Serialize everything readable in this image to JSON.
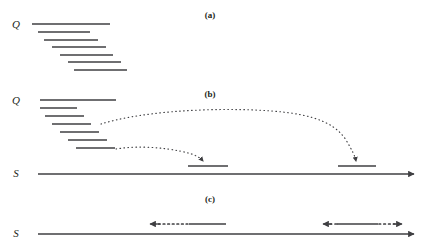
{
  "figure": {
    "width": 426,
    "height": 249,
    "background": "#ffffff",
    "ink_color": "#3f3f42",
    "text_color": "#231f20"
  },
  "panels": [
    {
      "id": "a",
      "label": "(a)",
      "label_x": 190,
      "label_y": 10,
      "axis_labels": [
        {
          "name": "query-label-a",
          "text": "Q",
          "x": 14,
          "y": 18
        }
      ],
      "segments": [
        {
          "x1": 32,
          "x2": 110,
          "y": 24
        },
        {
          "x1": 38,
          "x2": 90,
          "y": 32
        },
        {
          "x1": 44,
          "x2": 98,
          "y": 40
        },
        {
          "x1": 52,
          "x2": 106,
          "y": 47
        },
        {
          "x1": 60,
          "x2": 113,
          "y": 55
        },
        {
          "x1": 68,
          "x2": 121,
          "y": 62
        },
        {
          "x1": 74,
          "x2": 127,
          "y": 70
        }
      ]
    },
    {
      "id": "b",
      "label": "(b)",
      "label_x": 190,
      "label_y": 89,
      "axis_labels": [
        {
          "name": "query-label-b",
          "text": "Q",
          "x": 14,
          "y": 94
        },
        {
          "name": "subject-label-b",
          "text": "S",
          "x": 14,
          "y": 168
        }
      ],
      "segments": [
        {
          "x1": 40,
          "x2": 116,
          "y": 100
        },
        {
          "x1": 40,
          "x2": 77,
          "y": 108
        },
        {
          "x1": 45,
          "x2": 84,
          "y": 116
        },
        {
          "x1": 52,
          "x2": 91,
          "y": 124
        },
        {
          "x1": 60,
          "x2": 99,
          "y": 132
        },
        {
          "x1": 68,
          "x2": 107,
          "y": 140
        },
        {
          "x1": 76,
          "x2": 115,
          "y": 148
        }
      ],
      "subject_axis": {
        "x1": 38,
        "x2": 416,
        "y": 174,
        "arrow": "right"
      },
      "subject_hits": [
        {
          "name": "subject-hit-left",
          "x1": 188,
          "x2": 228,
          "y": 166
        },
        {
          "name": "subject-hit-right",
          "x1": 338,
          "x2": 376,
          "y": 166
        }
      ],
      "mapping_arrows": [
        {
          "name": "mapping-arrow-upper",
          "from_segment": 4,
          "to_hit": "subject-hit-right",
          "style": "dotted",
          "arrowhead": "down",
          "path": "M 101 124 C 140 112, 200 108, 255 110 C 300 112, 330 118, 345 138 C 352 148, 355 155, 356 162"
        },
        {
          "name": "mapping-arrow-lower",
          "from_segment": 7,
          "to_hit": "subject-hit-left",
          "style": "dotted",
          "arrowhead": "down",
          "path": "M 116 149 C 134 146, 150 147, 166 149 C 184 151, 196 153, 203 160"
        }
      ]
    },
    {
      "id": "c",
      "label": "(c)",
      "label_x": 190,
      "label_y": 194,
      "axis_labels": [
        {
          "name": "subject-label-c",
          "text": "S",
          "x": 14,
          "y": 228
        }
      ],
      "subject_axis": {
        "x1": 38,
        "x2": 416,
        "y": 234,
        "arrow": "right"
      },
      "intervals": [
        {
          "name": "interval-left",
          "left_arrow": true,
          "right_arrow": false,
          "x1": 148,
          "x2": 226,
          "dotted_from": 152,
          "dotted_to": 189,
          "solid_from": 189,
          "solid_to": 226,
          "y": 224
        },
        {
          "name": "interval-right",
          "left_arrow": true,
          "right_arrow": true,
          "x1": 322,
          "x2": 402,
          "dot_lead_from": 328,
          "dot_lead_to": 336,
          "solid_from": 336,
          "solid_to": 378,
          "dotted_from": 378,
          "dotted_to": 396,
          "y": 224
        }
      ]
    }
  ]
}
